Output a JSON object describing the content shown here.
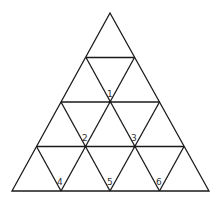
{
  "diagram": {
    "type": "triangular-grid",
    "rows": 4,
    "stroke_color": "#1a1a1a",
    "labels": [
      {
        "text": "1",
        "x": 108,
        "y": 96
      },
      {
        "text": "2",
        "x": 82,
        "y": 139
      },
      {
        "text": "3",
        "x": 131,
        "y": 139
      },
      {
        "text": "4",
        "x": 57,
        "y": 185
      },
      {
        "text": "5",
        "x": 107,
        "y": 185
      },
      {
        "text": "6",
        "x": 156,
        "y": 185
      }
    ]
  }
}
